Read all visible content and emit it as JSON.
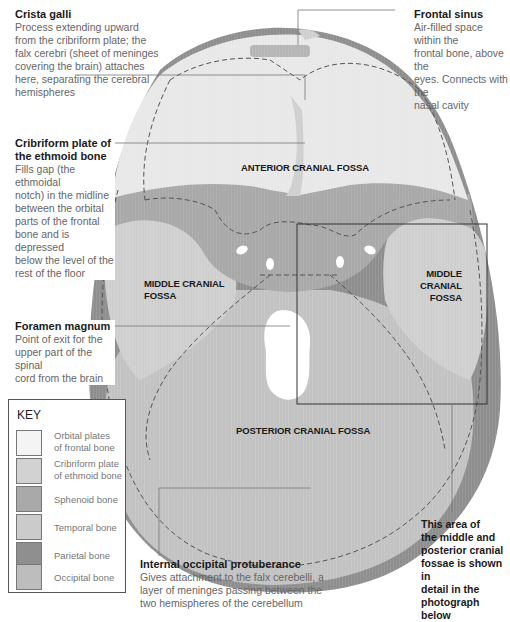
{
  "diagram": {
    "callouts": {
      "crista_galli": {
        "title": "Crista galli",
        "lines": [
          "Process extending upward",
          "from the cribriform plate; the",
          "falx cerebri (sheet of meninges",
          "covering the brain) attaches",
          "here, separating the cerebral",
          "hemispheres"
        ]
      },
      "frontal_sinus": {
        "title": "Frontal sinus",
        "lines": [
          "Air-filled space within the",
          "frontal bone, above the",
          "eyes. Connects with the",
          "nasal cavity"
        ]
      },
      "cribriform_plate": {
        "title_lines": [
          "Cribriform plate of",
          "the ethmoid bone"
        ],
        "lines": [
          "Fills gap (the ethmoidal",
          "notch) in the midline",
          "between the orbital",
          "parts of the frontal",
          "bone and is depressed",
          "below the level of the",
          "rest of the floor"
        ]
      },
      "foramen_magnum": {
        "title": "Foramen magnum",
        "lines": [
          "Point of exit for the",
          "upper part of the spinal",
          "cord from the brain"
        ]
      },
      "internal_occipital_protuberance": {
        "title": "Internal occipital protuberance",
        "lines": [
          "Gives attachment to the falx cerebelli, a",
          "layer of meninges passing between the",
          "two hemispheres of the cerebellum"
        ]
      },
      "detail_area": {
        "lines": [
          "This area of",
          "the middle and",
          "posterior cranial",
          "fossae is shown in",
          "detail in the",
          "photograph below"
        ]
      }
    },
    "regions": {
      "anterior": "ANTERIOR CRANIAL FOSSA",
      "middle_left_lines": [
        "MIDDLE CRANIAL",
        "FOSSA"
      ],
      "middle_right_lines": [
        "MIDDLE CRANIAL",
        "FOSSA"
      ],
      "posterior": "POSTERIOR CRANIAL FOSSA"
    },
    "key": {
      "title": "KEY",
      "items": [
        {
          "label_lines": [
            "Orbital plates",
            "of frontal bone"
          ],
          "color": "#f4f4f4"
        },
        {
          "label_lines": [
            "Cribriform plate",
            "of ethmoid bone"
          ],
          "color": "#d2d2d2"
        },
        {
          "label_lines": [
            "Sphenoid bone"
          ],
          "color": "#a9a9a9"
        },
        {
          "label_lines": [
            "Temporal bone"
          ],
          "color": "#cbcbcb"
        },
        {
          "label_lines": [
            "Parietal bone"
          ],
          "color": "#8f8f8f"
        },
        {
          "label_lines": [
            "Occipital bone"
          ],
          "color": "#bdbdbd"
        }
      ]
    },
    "colors": {
      "frontal": "#e6e6e6",
      "sphenoid": "#a8a8a8",
      "temporal": "#cfcfcf",
      "parietal": "#8e8e8e",
      "occipital": "#c2c2c2",
      "leader_line": "#777777",
      "dashed_border": "#555555"
    }
  }
}
